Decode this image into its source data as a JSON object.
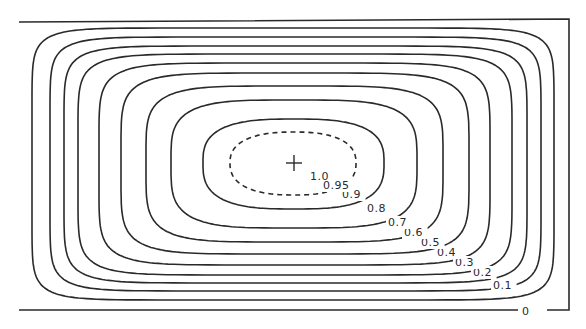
{
  "chart_data": {
    "type": "contour",
    "title": "",
    "xlabel": "",
    "ylabel": "",
    "grid": false,
    "legend": "none",
    "center_marker": {
      "shape": "plus",
      "x": 294,
      "y": 163
    },
    "frame": {
      "left": 19,
      "top": 19,
      "right": 569,
      "bottom": 310
    },
    "levels": [
      {
        "value": "0",
        "label": "0",
        "style": "solid",
        "left": 19,
        "right": 569,
        "top": 19,
        "bottom": 310,
        "label_x": 522,
        "label_y": 315
      },
      {
        "value": "0.1",
        "label": "0.1",
        "style": "solid",
        "left": 32,
        "right": 554,
        "top": 28,
        "bottom": 300,
        "label_x": 493,
        "label_y": 289
      },
      {
        "value": "0.2",
        "label": "0.2",
        "style": "solid",
        "left": 50,
        "right": 541,
        "top": 37,
        "bottom": 291,
        "label_x": 473,
        "label_y": 276
      },
      {
        "value": "0.3",
        "label": "0.3",
        "style": "solid",
        "left": 64,
        "right": 527,
        "top": 46,
        "bottom": 283,
        "label_x": 455,
        "label_y": 266
      },
      {
        "value": "0.4",
        "label": "0.4",
        "style": "solid",
        "left": 78,
        "right": 512,
        "top": 54,
        "bottom": 275,
        "label_x": 437,
        "label_y": 256
      },
      {
        "value": "0.5",
        "label": "0.5",
        "style": "solid",
        "left": 99,
        "right": 490,
        "top": 63,
        "bottom": 265,
        "label_x": 421,
        "label_y": 246
      },
      {
        "value": "0.6",
        "label": "0.6",
        "style": "solid",
        "left": 121,
        "right": 469,
        "top": 73,
        "bottom": 254,
        "label_x": 404,
        "label_y": 236
      },
      {
        "value": "0.7",
        "label": "0.7",
        "style": "solid",
        "left": 146,
        "right": 443,
        "top": 86,
        "bottom": 242,
        "label_x": 388,
        "label_y": 226
      },
      {
        "value": "0.8",
        "label": "0.8",
        "style": "solid",
        "left": 171,
        "right": 417,
        "top": 100,
        "bottom": 228,
        "label_x": 367,
        "label_y": 212
      },
      {
        "value": "0.9",
        "label": "0.9",
        "style": "solid",
        "left": 203,
        "right": 384,
        "top": 119,
        "bottom": 209,
        "label_x": 342,
        "label_y": 198
      },
      {
        "value": "0.95",
        "label": "0.95",
        "style": "dashed",
        "left": 230,
        "right": 356,
        "top": 132,
        "bottom": 195,
        "label_x": 323,
        "label_y": 189
      },
      {
        "value": "1.0",
        "label": "1.0",
        "style": "point",
        "label_x": 310,
        "label_y": 180
      }
    ]
  }
}
